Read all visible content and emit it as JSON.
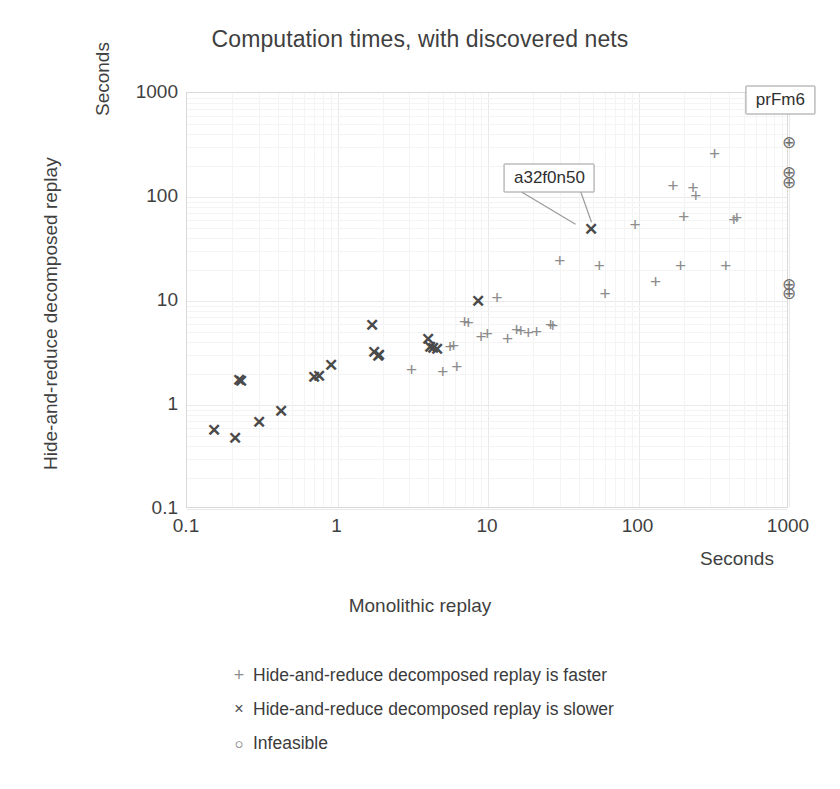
{
  "chart_data": {
    "type": "scatter",
    "title": "Computation times, with discovered nets",
    "xlabel": "Monolithic replay",
    "ylabel": "Hide-and-reduce decomposed replay",
    "x_unit_label": "Seconds",
    "y_unit_label": "Seconds",
    "xscale": "log",
    "yscale": "log",
    "xlim": [
      0.1,
      1000
    ],
    "ylim": [
      0.1,
      1000
    ],
    "xticks": [
      "0.1",
      "1",
      "10",
      "100",
      "1000"
    ],
    "yticks": [
      "1000",
      "100",
      "10",
      "1",
      "0.1"
    ],
    "grid": true,
    "legend_position": "below",
    "legend": [
      {
        "glyph": "+",
        "label": "Hide-and-reduce decomposed replay is faster"
      },
      {
        "glyph": "×",
        "label": "Hide-and-reduce decomposed replay is slower"
      },
      {
        "glyph": "○",
        "label": "Infeasible"
      }
    ],
    "annotations": [
      {
        "text": "prFm6",
        "box_x": 890,
        "box_y": 840,
        "target_x": 1000,
        "target_y": 1000
      },
      {
        "text": "a32f0n50",
        "box_x": 26,
        "box_y": 150,
        "target_x": 48,
        "target_y": 49
      }
    ],
    "series": [
      {
        "name": "Hide-and-reduce decomposed replay is slower",
        "marker": "cross",
        "color": "#4a4a4a",
        "points": [
          [
            0.15,
            0.57
          ],
          [
            0.21,
            0.48
          ],
          [
            0.22,
            1.75
          ],
          [
            0.23,
            1.72
          ],
          [
            0.3,
            0.68
          ],
          [
            0.42,
            0.88
          ],
          [
            0.7,
            1.85
          ],
          [
            0.75,
            1.9
          ],
          [
            0.9,
            2.4
          ],
          [
            1.7,
            5.9
          ],
          [
            1.75,
            3.2
          ],
          [
            1.85,
            2.95
          ],
          [
            1.9,
            3.05
          ],
          [
            4.0,
            4.3
          ],
          [
            4.1,
            3.6
          ],
          [
            4.3,
            3.5
          ],
          [
            4.6,
            3.45
          ],
          [
            8.6,
            9.9
          ],
          [
            48,
            49
          ]
        ]
      },
      {
        "name": "Hide-and-reduce decomposed replay is faster",
        "marker": "plus",
        "color": "#8d8d8d",
        "points": [
          [
            3.1,
            2.2
          ],
          [
            5.0,
            2.1
          ],
          [
            5.6,
            3.7
          ],
          [
            5.9,
            3.75
          ],
          [
            6.2,
            2.35
          ],
          [
            7.0,
            6.4
          ],
          [
            7.4,
            6.3
          ],
          [
            9.0,
            4.6
          ],
          [
            9.9,
            4.9
          ],
          [
            11.5,
            11.0
          ],
          [
            13.5,
            4.4
          ],
          [
            15.5,
            5.4
          ],
          [
            16.5,
            5.3
          ],
          [
            18.5,
            5.0
          ],
          [
            21,
            5.1
          ],
          [
            26,
            6.0
          ],
          [
            27,
            5.9
          ],
          [
            30,
            25
          ],
          [
            55,
            22
          ],
          [
            60,
            12.0
          ],
          [
            95,
            55
          ],
          [
            130,
            15.5
          ],
          [
            170,
            130
          ],
          [
            190,
            22
          ],
          [
            200,
            65
          ],
          [
            230,
            125
          ],
          [
            240,
            105
          ],
          [
            320,
            265
          ],
          [
            380,
            22
          ],
          [
            430,
            62
          ],
          [
            450,
            64
          ]
        ]
      },
      {
        "name": "Infeasible",
        "marker": "circle",
        "color": "#6f6f6f",
        "points": [
          [
            1000,
            1000
          ],
          [
            1000,
            880
          ],
          [
            1000,
            340
          ],
          [
            1000,
            175
          ],
          [
            1000,
            140
          ],
          [
            1000,
            14.5
          ],
          [
            1000,
            12.0
          ]
        ]
      }
    ]
  }
}
